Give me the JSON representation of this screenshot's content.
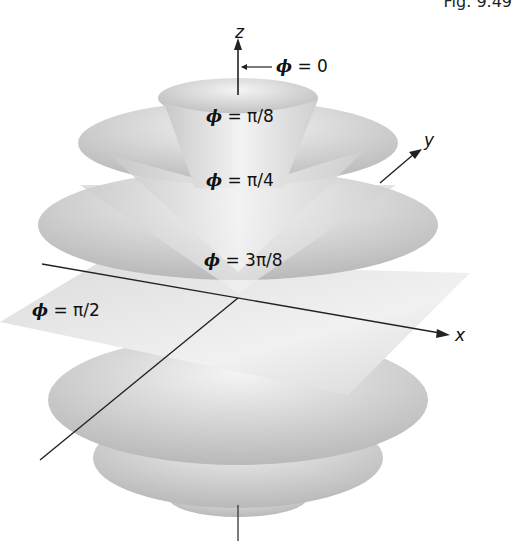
{
  "figure": {
    "label": "Fig. 9.49",
    "axes": {
      "z": "z",
      "y": "y",
      "x": "x"
    },
    "surfaces": [
      {
        "name": "phi-0",
        "phi": "ϕ",
        "eq": "= 0"
      },
      {
        "name": "phi-pi-8",
        "phi": "ϕ",
        "eq": "= π/8"
      },
      {
        "name": "phi-pi-4",
        "phi": "ϕ",
        "eq": "= π/4"
      },
      {
        "name": "phi-3pi-8",
        "phi": "ϕ",
        "eq": "= 3π/8"
      },
      {
        "name": "phi-pi-2",
        "phi": "ϕ",
        "eq": "= π/2"
      }
    ]
  },
  "colors": {
    "surface_light": "#f2f2f2",
    "surface_dark": "#b8b8b8",
    "axis": "#222222"
  }
}
